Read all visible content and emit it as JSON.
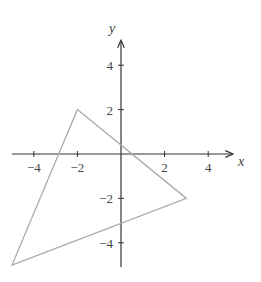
{
  "chart_data": {
    "type": "scatter",
    "title": "",
    "xlabel": "x",
    "ylabel": "y",
    "xlim": [
      -5,
      5
    ],
    "ylim": [
      -5,
      5
    ],
    "grid": false,
    "x_ticks": [
      -4,
      -2,
      2,
      4
    ],
    "y_ticks": [
      4,
      2,
      -2,
      -4
    ],
    "x_tick_labels": [
      "−4",
      "−2",
      "2",
      "4"
    ],
    "y_tick_labels": [
      "4",
      "2",
      "−2",
      "−4"
    ],
    "shapes": [
      {
        "name": "triangle",
        "kind": "polygon",
        "vertices": [
          [
            -2,
            2
          ],
          [
            3,
            -2
          ],
          [
            -5,
            -5
          ]
        ],
        "color": "#aaaaaa"
      }
    ],
    "axis_color": "#333333"
  }
}
